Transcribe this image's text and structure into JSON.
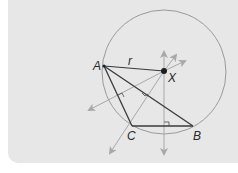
{
  "diagram": {
    "colors": {
      "background": "#e7e7e7",
      "circle": "#9a9a9a",
      "triangle": "#3a3a3a",
      "bisector": "#a8a8a8",
      "point": "#1e1e1e",
      "text": "#2a2a2a"
    },
    "points": {
      "A": {
        "label": "A",
        "x": 104,
        "y": 66
      },
      "B": {
        "label": "B",
        "x": 193,
        "y": 126
      },
      "C": {
        "label": "C",
        "x": 132,
        "y": 126
      },
      "X": {
        "label": "X",
        "x": 164,
        "y": 71
      }
    },
    "circle": {
      "cx": 164,
      "cy": 72,
      "r": 62
    },
    "segment_labels": {
      "AX": "r"
    },
    "perpendicular_bisectors": [
      {
        "name": "bisector-AC",
        "through": "X",
        "direction": "toward lower-left"
      },
      {
        "name": "bisector-AB",
        "through": "X",
        "direction": "toward C, lower-left"
      },
      {
        "name": "bisector-CB",
        "through": "X",
        "direction": "vertical"
      }
    ]
  }
}
